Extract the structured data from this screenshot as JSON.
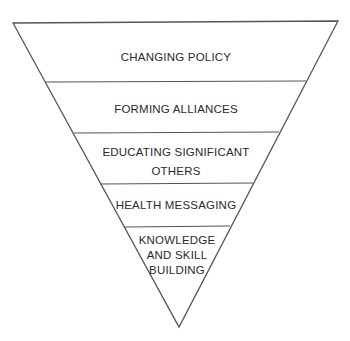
{
  "diagram": {
    "type": "inverted-pyramid",
    "stroke_color": "#555555",
    "text_color": "#2a2a2a",
    "layers": [
      {
        "label_lines": [
          "CHANGING POLICY"
        ]
      },
      {
        "label_lines": [
          "FORMING ALLIANCES"
        ]
      },
      {
        "label_lines": [
          "EDUCATING SIGNIFICANT",
          "OTHERS"
        ]
      },
      {
        "label_lines": [
          "HEALTH MESSAGING"
        ]
      },
      {
        "label_lines": [
          "KNOWLEDGE",
          "AND SKILL",
          "BUILDING"
        ]
      }
    ]
  }
}
